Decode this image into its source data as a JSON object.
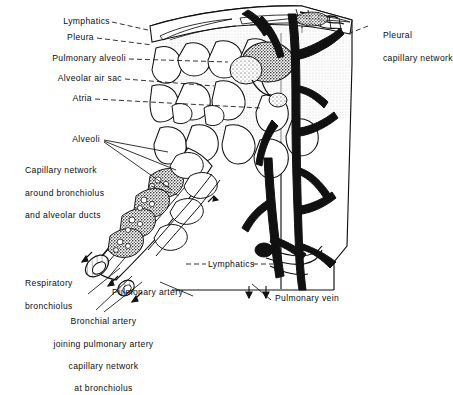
{
  "figure": {
    "kind": "anatomical-illustration",
    "style": "black-and-white line engraving with stipple shading",
    "background_color": "#ffffff",
    "ink_color": "#0d0d0d"
  },
  "labels": {
    "lymphatics_top": "Lymphatics",
    "pleura": "Pleura",
    "pulmonary_alveoli": "Pulmonary alveoli",
    "alveolar_air_sac": "Alveolar air sac",
    "atria": "Atria",
    "alveoli": "Alveoli",
    "capillary_network_line1": "Capillary network",
    "capillary_network_line2": "around bronchiolus",
    "capillary_network_line3": "and alveolar ducts",
    "respiratory_bronchiolus_line1": "Respiratory",
    "respiratory_bronchiolus_line2": "bronchiolus",
    "bronchial_artery_line1": "Bronchial artery",
    "bronchial_artery_line2": "joining pulmonary artery",
    "bronchial_artery_line3": "capillary network",
    "bronchial_artery_line4": "at bronchiolus",
    "lymphatics_mid": "Lymphatics",
    "pulmonary_artery": "Pulmonary artery",
    "pulmonary_vein": "Pulmonary vein",
    "pleural_capillary_line1": "Pleural",
    "pleural_capillary_line2": "capillary network"
  }
}
